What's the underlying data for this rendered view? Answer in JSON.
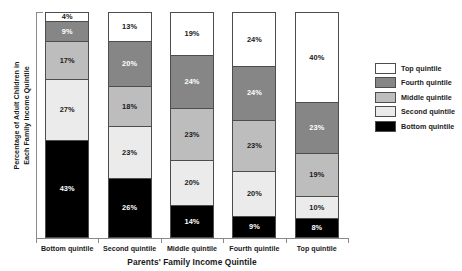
{
  "chart_data": {
    "type": "bar",
    "subtype": "stacked-bar-100",
    "title": "",
    "xlabel": "Parents' Family Income Quintile",
    "ylabel": "Percentage of Adult Children in\nEach Family Income Quintile",
    "ylim": [
      0,
      100
    ],
    "grid": false,
    "legend_position": "right",
    "categories": [
      "Bottom quintile",
      "Second quintile",
      "Middle quintile",
      "Fourth quintile",
      "Top quintile"
    ],
    "series": [
      {
        "name": "Top quintile",
        "color": "#ffffff",
        "values": [
          4,
          13,
          19,
          24,
          40
        ]
      },
      {
        "name": "Fourth quintile",
        "color": "#868686",
        "values": [
          9,
          20,
          24,
          24,
          23
        ]
      },
      {
        "name": "Middle quintile",
        "color": "#bdbdbd",
        "values": [
          17,
          18,
          23,
          23,
          19
        ]
      },
      {
        "name": "Second quintile",
        "color": "#ebebeb",
        "values": [
          27,
          23,
          20,
          20,
          10
        ]
      },
      {
        "name": "Bottom quintile",
        "color": "#000000",
        "values": [
          43,
          26,
          14,
          9,
          8
        ]
      }
    ],
    "bars": [
      {
        "category": "Bottom quintile",
        "segments": [
          {
            "series": "Top quintile",
            "value": 4,
            "label": "4%",
            "tone": "s-top"
          },
          {
            "series": "Fourth quintile",
            "value": 9,
            "label": "9%",
            "tone": "s-fourth"
          },
          {
            "series": "Middle quintile",
            "value": 17,
            "label": "17%",
            "tone": "s-middle"
          },
          {
            "series": "Second quintile",
            "value": 27,
            "label": "27%",
            "tone": "s-second"
          },
          {
            "series": "Bottom quintile",
            "value": 43,
            "label": "43%",
            "tone": "s-bottom"
          }
        ]
      },
      {
        "category": "Second quintile",
        "segments": [
          {
            "series": "Top quintile",
            "value": 13,
            "label": "13%",
            "tone": "s-top"
          },
          {
            "series": "Fourth quintile",
            "value": 20,
            "label": "20%",
            "tone": "s-fourth"
          },
          {
            "series": "Middle quintile",
            "value": 18,
            "label": "18%",
            "tone": "s-middle"
          },
          {
            "series": "Second quintile",
            "value": 23,
            "label": "23%",
            "tone": "s-second"
          },
          {
            "series": "Bottom quintile",
            "value": 26,
            "label": "26%",
            "tone": "s-bottom"
          }
        ]
      },
      {
        "category": "Middle quintile",
        "segments": [
          {
            "series": "Top quintile",
            "value": 19,
            "label": "19%",
            "tone": "s-top"
          },
          {
            "series": "Fourth quintile",
            "value": 24,
            "label": "24%",
            "tone": "s-fourth"
          },
          {
            "series": "Middle quintile",
            "value": 23,
            "label": "23%",
            "tone": "s-middle"
          },
          {
            "series": "Second quintile",
            "value": 20,
            "label": "20%",
            "tone": "s-second"
          },
          {
            "series": "Bottom quintile",
            "value": 14,
            "label": "14%",
            "tone": "s-bottom"
          }
        ]
      },
      {
        "category": "Fourth quintile",
        "segments": [
          {
            "series": "Top quintile",
            "value": 24,
            "label": "24%",
            "tone": "s-top"
          },
          {
            "series": "Fourth quintile",
            "value": 24,
            "label": "24%",
            "tone": "s-fourth"
          },
          {
            "series": "Middle quintile",
            "value": 23,
            "label": "23%",
            "tone": "s-middle"
          },
          {
            "series": "Second quintile",
            "value": 20,
            "label": "20%",
            "tone": "s-second"
          },
          {
            "series": "Bottom quintile",
            "value": 9,
            "label": "9%",
            "tone": "s-bottom"
          }
        ]
      },
      {
        "category": "Top quintile",
        "segments": [
          {
            "series": "Top quintile",
            "value": 40,
            "label": "40%",
            "tone": "s-top"
          },
          {
            "series": "Fourth quintile",
            "value": 23,
            "label": "23%",
            "tone": "s-fourth"
          },
          {
            "series": "Middle quintile",
            "value": 19,
            "label": "19%",
            "tone": "s-middle"
          },
          {
            "series": "Second quintile",
            "value": 10,
            "label": "10%",
            "tone": "s-second"
          },
          {
            "series": "Bottom quintile",
            "value": 8,
            "label": "8%",
            "tone": "s-bottom"
          }
        ]
      }
    ],
    "legend": [
      {
        "label": "Top quintile",
        "tone": "s-top",
        "color": "#ffffff"
      },
      {
        "label": "Fourth quintile",
        "tone": "s-fourth",
        "color": "#868686"
      },
      {
        "label": "Middle quintile",
        "tone": "s-middle",
        "color": "#bdbdbd"
      },
      {
        "label": "Second quintile",
        "tone": "s-second",
        "color": "#ebebeb"
      },
      {
        "label": "Bottom quintile",
        "tone": "s-bottom",
        "color": "#000000"
      }
    ]
  }
}
